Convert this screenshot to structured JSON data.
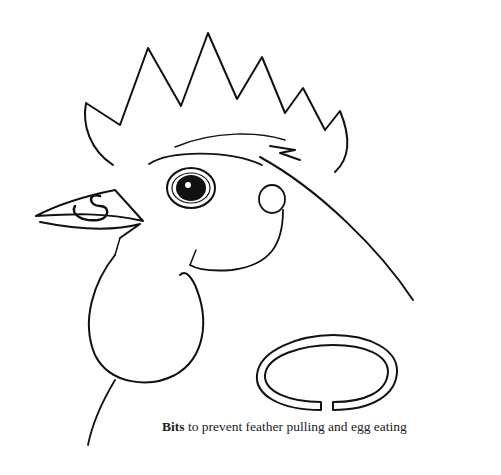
{
  "illustration": {
    "subject": "rooster head with anti-pecking bit in beak",
    "parts": [
      "comb",
      "eye",
      "beak",
      "bit-in-nostrils",
      "wattle",
      "earlobe",
      "neck"
    ],
    "detached_bit": "open C-shaped ring"
  },
  "caption": {
    "bold": "Bits",
    "rest": " to prevent feather pulling and egg eating"
  },
  "colors": {
    "ink": "#111111",
    "background": "#ffffff"
  }
}
